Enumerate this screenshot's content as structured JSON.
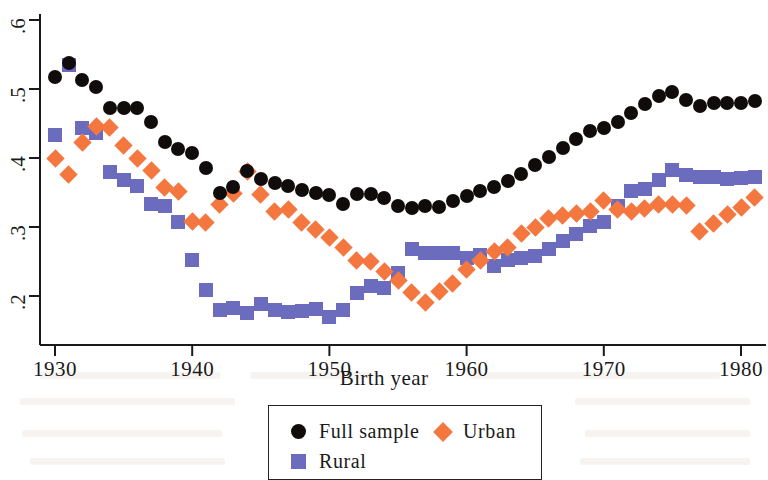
{
  "chart_data": {
    "type": "scatter",
    "title": "",
    "xlabel": "Birth year",
    "ylabel": "",
    "xlim": [
      1929.2,
      1981.8
    ],
    "ylim": [
      0.155,
      0.615
    ],
    "grid": false,
    "legend_position": "below-axes",
    "xticks": [
      1930,
      1940,
      1950,
      1960,
      1970,
      1980
    ],
    "xtick_labels": [
      "1930",
      "1940",
      "1950",
      "1960",
      "1970",
      "1980"
    ],
    "yticks": [
      0.2,
      0.3,
      0.4,
      0.5,
      0.6
    ],
    "ytick_labels": [
      ".2",
      ".3",
      ".4",
      ".5",
      ".6"
    ],
    "colors": {
      "full_sample": "#100c0c",
      "rural": "#6c6cbe",
      "urban": "#f4773f"
    },
    "series": [
      {
        "name": "Full sample",
        "marker": "circle",
        "color": "#100c0c",
        "x": [
          1930,
          1931,
          1932,
          1933,
          1934,
          1935,
          1936,
          1937,
          1938,
          1939,
          1940,
          1941,
          1942,
          1943,
          1944,
          1945,
          1946,
          1947,
          1948,
          1949,
          1950,
          1951,
          1952,
          1953,
          1954,
          1955,
          1956,
          1957,
          1958,
          1959,
          1960,
          1961,
          1962,
          1963,
          1964,
          1965,
          1966,
          1967,
          1968,
          1969,
          1970,
          1971,
          1972,
          1973,
          1974,
          1975,
          1976,
          1977,
          1978,
          1979,
          1980,
          1981
        ],
        "y": [
          0.518,
          0.538,
          0.513,
          0.503,
          0.472,
          0.472,
          0.473,
          0.452,
          0.423,
          0.413,
          0.407,
          0.385,
          0.35,
          0.358,
          0.381,
          0.37,
          0.364,
          0.359,
          0.354,
          0.35,
          0.347,
          0.333,
          0.348,
          0.348,
          0.342,
          0.331,
          0.328,
          0.331,
          0.329,
          0.338,
          0.345,
          0.352,
          0.358,
          0.366,
          0.377,
          0.39,
          0.402,
          0.415,
          0.428,
          0.439,
          0.443,
          0.452,
          0.465,
          0.478,
          0.49,
          0.495,
          0.484,
          0.476,
          0.479,
          0.48,
          0.479,
          0.482
        ]
      },
      {
        "name": "Rural",
        "marker": "square",
        "color": "#6c6cbe",
        "x": [
          1930,
          1931,
          1932,
          1933,
          1934,
          1935,
          1936,
          1937,
          1938,
          1939,
          1940,
          1941,
          1942,
          1943,
          1944,
          1945,
          1946,
          1947,
          1948,
          1949,
          1950,
          1951,
          1952,
          1953,
          1954,
          1955,
          1956,
          1957,
          1958,
          1959,
          1960,
          1961,
          1962,
          1963,
          1964,
          1965,
          1966,
          1967,
          1968,
          1969,
          1970,
          1971,
          1972,
          1973,
          1974,
          1975,
          1976,
          1977,
          1978,
          1979,
          1980,
          1981
        ],
        "y": [
          0.433,
          0.535,
          0.443,
          0.436,
          0.38,
          0.368,
          0.36,
          0.333,
          0.33,
          0.307,
          0.252,
          0.208,
          0.18,
          0.182,
          0.175,
          0.188,
          0.179,
          0.177,
          0.178,
          0.181,
          0.17,
          0.18,
          0.205,
          0.215,
          0.212,
          0.233,
          0.268,
          0.263,
          0.262,
          0.262,
          0.255,
          0.259,
          0.243,
          0.252,
          0.255,
          0.258,
          0.268,
          0.28,
          0.29,
          0.302,
          0.307,
          0.33,
          0.352,
          0.355,
          0.368,
          0.382,
          0.375,
          0.372,
          0.372,
          0.37,
          0.371,
          0.373
        ]
      },
      {
        "name": "Urban",
        "marker": "diamond",
        "color": "#f4773f",
        "x": [
          1930,
          1931,
          1932,
          1933,
          1934,
          1935,
          1936,
          1937,
          1938,
          1939,
          1940,
          1941,
          1942,
          1943,
          1944,
          1945,
          1946,
          1947,
          1948,
          1949,
          1950,
          1951,
          1952,
          1953,
          1954,
          1955,
          1956,
          1957,
          1958,
          1959,
          1960,
          1961,
          1962,
          1963,
          1964,
          1965,
          1966,
          1967,
          1968,
          1969,
          1970,
          1971,
          1972,
          1973,
          1974,
          1975,
          1976,
          1977,
          1978,
          1979,
          1980,
          1981
        ],
        "y": [
          0.4,
          0.376,
          0.422,
          0.446,
          0.444,
          0.418,
          0.4,
          0.382,
          0.357,
          0.352,
          0.308,
          0.306,
          0.333,
          0.348,
          0.381,
          0.347,
          0.322,
          0.325,
          0.307,
          0.296,
          0.285,
          0.27,
          0.252,
          0.25,
          0.236,
          0.222,
          0.205,
          0.19,
          0.207,
          0.218,
          0.238,
          0.252,
          0.265,
          0.27,
          0.29,
          0.3,
          0.312,
          0.317,
          0.32,
          0.322,
          0.338,
          0.325,
          0.323,
          0.327,
          0.332,
          0.332,
          0.331,
          0.294,
          0.305,
          0.318,
          0.328,
          0.343
        ]
      }
    ]
  },
  "axes": {
    "x_title": "Birth year"
  },
  "legend": {
    "items": [
      {
        "label": "Full sample",
        "marker": "circle",
        "color": "#100c0c"
      },
      {
        "label": "Urban",
        "marker": "diamond",
        "color": "#f4773f"
      },
      {
        "label": "Rural",
        "marker": "square",
        "color": "#6c6cbe"
      }
    ]
  }
}
